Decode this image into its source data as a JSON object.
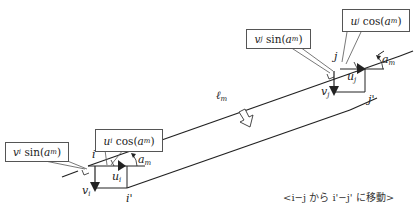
{
  "diagram": {
    "member_label": {
      "sym": "ℓ",
      "sub": "m"
    },
    "node_i": "i",
    "node_j": "j",
    "node_i_prime": "i'",
    "node_j_prime": "j'",
    "u_i": {
      "sym": "u",
      "sub": "i"
    },
    "v_i": {
      "sym": "v",
      "sub": "i"
    },
    "u_j": {
      "sym": "u",
      "sub": "j"
    },
    "v_j": {
      "sym": "v",
      "sub": "j"
    },
    "angle_i": {
      "sym": "a",
      "sub": "m"
    },
    "angle_j": {
      "sym": "a",
      "sub": "m"
    },
    "callouts": {
      "vi_sin": {
        "var": "v",
        "var_sub": "i",
        "func": "sin(",
        "arg": "a",
        "arg_sub": "m",
        "close": ")"
      },
      "ui_cos": {
        "var": "u",
        "var_sub": "i",
        "func": "cos(",
        "arg": "a",
        "arg_sub": "m",
        "close": ")"
      },
      "vj_sin": {
        "var": "v",
        "var_sub": "j",
        "func": "sin(",
        "arg": "a",
        "arg_sub": "m",
        "close": ")"
      },
      "uj_cos": {
        "var": "u",
        "var_sub": "j",
        "func": "cos(",
        "arg": "a",
        "arg_sub": "m",
        "close": ")"
      }
    },
    "caption": "<i−j から i'−j' に移動>"
  }
}
